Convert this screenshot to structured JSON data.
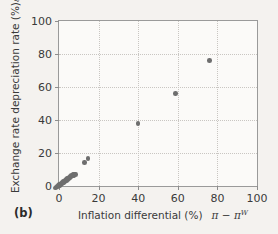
{
  "figure": {
    "panel_label": "(b)",
    "background_color": "#f4f2ef",
    "plot_background_color": "#fbfaf8",
    "frame_color": "#9a9a9a",
    "grid_color": "#c9c6c2",
    "marker_color": "#6e6e6e"
  },
  "axes": {
    "y_title_text": "Exchange rate depreciation rate (%)",
    "y_title_symbol": "ε",
    "x_title_text": "Inflation differential (%)",
    "x_title_symbol_pi": "π",
    "x_title_symbol_minus": "−",
    "x_title_symbol_pi_world": "π",
    "x_title_symbol_superscript": "W"
  },
  "chart_data": {
    "type": "scatter",
    "title": "",
    "xlabel": "Inflation differential (%)  π − πᵂ",
    "ylabel": "Exchange rate depreciation rate (%)  ε",
    "xlim": [
      0,
      100
    ],
    "ylim": [
      0,
      100
    ],
    "xticks": [
      0,
      20,
      40,
      60,
      80,
      100
    ],
    "yticks": [
      0,
      20,
      40,
      60,
      80,
      100
    ],
    "xtick_labels": [
      "0",
      "20",
      "40",
      "60",
      "80",
      "100"
    ],
    "ytick_labels": [
      "0",
      "20",
      "40",
      "60",
      "80",
      "100"
    ],
    "grid": true,
    "legend": null,
    "series": [
      {
        "name": "Countries",
        "marker": "circle",
        "color": "#6e6e6e",
        "points": [
          [
            -1.8,
            -1.2
          ],
          [
            -1.2,
            -0.6
          ],
          [
            -0.7,
            -0.3
          ],
          [
            -0.3,
            0.2
          ],
          [
            0.1,
            0.4
          ],
          [
            0.4,
            0.8
          ],
          [
            0.6,
            0.3
          ],
          [
            0.9,
            1.1
          ],
          [
            1.1,
            0.6
          ],
          [
            1.3,
            1.5
          ],
          [
            1.6,
            1.2
          ],
          [
            1.8,
            2.1
          ],
          [
            2.0,
            1.7
          ],
          [
            2.2,
            2.6
          ],
          [
            2.5,
            2.2
          ],
          [
            2.7,
            3.1
          ],
          [
            2.9,
            2.5
          ],
          [
            3.2,
            3.6
          ],
          [
            3.4,
            3.0
          ],
          [
            3.6,
            4.0
          ],
          [
            3.9,
            3.4
          ],
          [
            4.1,
            4.4
          ],
          [
            4.4,
            3.9
          ],
          [
            4.6,
            4.8
          ],
          [
            4.9,
            4.3
          ],
          [
            5.2,
            5.3
          ],
          [
            5.5,
            4.9
          ],
          [
            5.8,
            5.8
          ],
          [
            6.1,
            5.4
          ],
          [
            6.4,
            6.3
          ],
          [
            6.8,
            6.0
          ],
          [
            7.1,
            6.8
          ],
          [
            7.5,
            6.5
          ],
          [
            7.9,
            7.2
          ],
          [
            8.3,
            7.0
          ],
          [
            12.8,
            14.2
          ],
          [
            14.7,
            16.8
          ],
          [
            39.8,
            37.8
          ],
          [
            58.8,
            56.2
          ],
          [
            76.0,
            76.0
          ]
        ]
      }
    ]
  }
}
